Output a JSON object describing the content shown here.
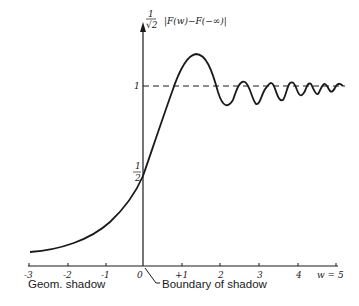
{
  "diagram": {
    "y_axis_label_prefix_num": "1",
    "y_axis_label_prefix_den": "√2",
    "y_axis_label": "|F(w)−F(−∞)|",
    "y_tick_one": "1",
    "y_tick_half_num": "1",
    "y_tick_half_den": "2",
    "x_ticks": [
      "-3",
      "-2",
      "-1",
      "0",
      "+1",
      "2",
      "3",
      "4",
      "w = 5"
    ],
    "annotations": {
      "geom_shadow": "Geom. shadow",
      "boundary": "Boundary of shadow"
    },
    "colors": {
      "ink": "#1a1a1a",
      "background": "#ffffff"
    }
  }
}
